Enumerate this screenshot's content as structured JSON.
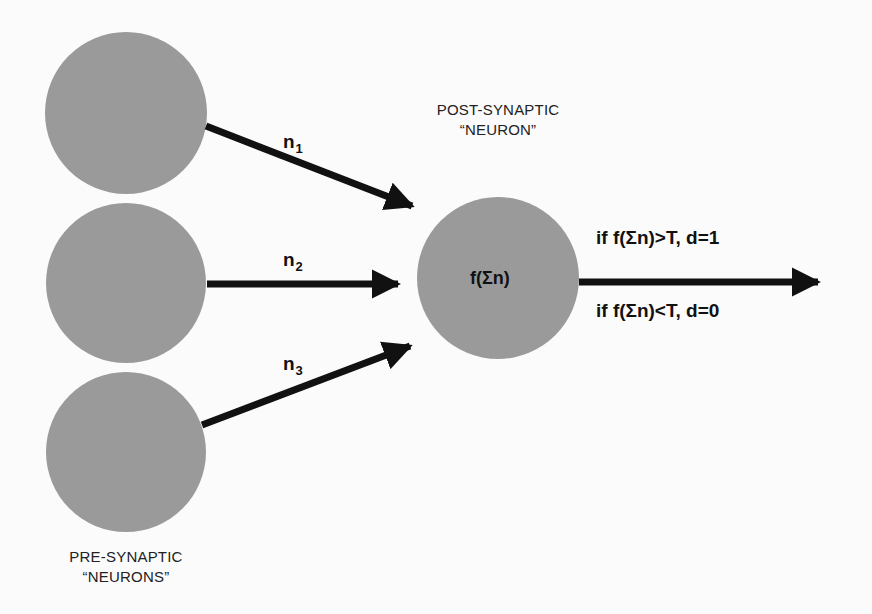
{
  "diagram": {
    "colors": {
      "background": "#fbfbfb",
      "neuron_fill": "#9a9a9a",
      "arrow": "#111111"
    },
    "pre_synaptic_label": {
      "line1": "PRE-SYNAPTIC",
      "line2": "“NEURONS”"
    },
    "post_synaptic_label": {
      "line1": "POST-SYNAPTIC",
      "line2": "“NEURON”"
    },
    "inputs": [
      {
        "base": "n",
        "sub": "1"
      },
      {
        "base": "n",
        "sub": "2"
      },
      {
        "base": "n",
        "sub": "3"
      }
    ],
    "post_neuron_function": "f(Σn)",
    "output_rules": {
      "above": "if f(Σn)>T, d=1",
      "below": "if f(Σn)<T, d=0"
    }
  }
}
